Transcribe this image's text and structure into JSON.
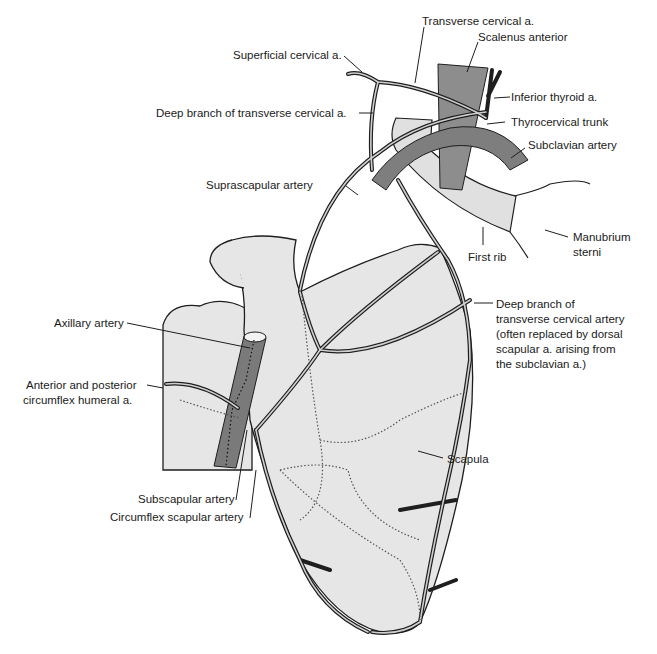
{
  "diagram": {
    "colors": {
      "bone_fill": "#e6e6e6",
      "outline": "#1e1e1e",
      "artery_fill": "#8a8a8a",
      "artery_dark": "#6e6e6e",
      "muscle_fill": "#8d8d8d",
      "rib_fill": "#e0e0e0",
      "background": "#ffffff"
    },
    "labels": {
      "transverse_cervical": "Transverse cervical a.",
      "scalenus_anterior": "Scalenus anterior",
      "superficial_cervical": "Superficial cervical a.",
      "inferior_thyroid": "Inferior thyroid a.",
      "deep_branch_tca_short": "Deep branch of transverse cervical a.",
      "thyrocervical_trunk": "Thyrocervical trunk",
      "subclavian_artery": "Subclavian artery",
      "suprascapular_artery": "Suprascapular artery",
      "manubrium_sterni_1": "Manubrium",
      "manubrium_sterni_2": "sterni",
      "first_rib": "First rib",
      "deep_branch_long_1": "Deep branch of",
      "deep_branch_long_2": "transverse cervical artery",
      "deep_branch_long_3": "(often replaced by dorsal",
      "deep_branch_long_4": "scapular a. arising from",
      "deep_branch_long_5": "the subclavian a.)",
      "axillary_artery": "Axillary artery",
      "circumflex_humeral_1": "Anterior and posterior",
      "circumflex_humeral_2": "circumflex humeral  a.",
      "scapula": "Scapula",
      "subscapular_artery": "Subscapular artery",
      "circumflex_scapular_artery": "Circumflex scapular artery"
    }
  }
}
